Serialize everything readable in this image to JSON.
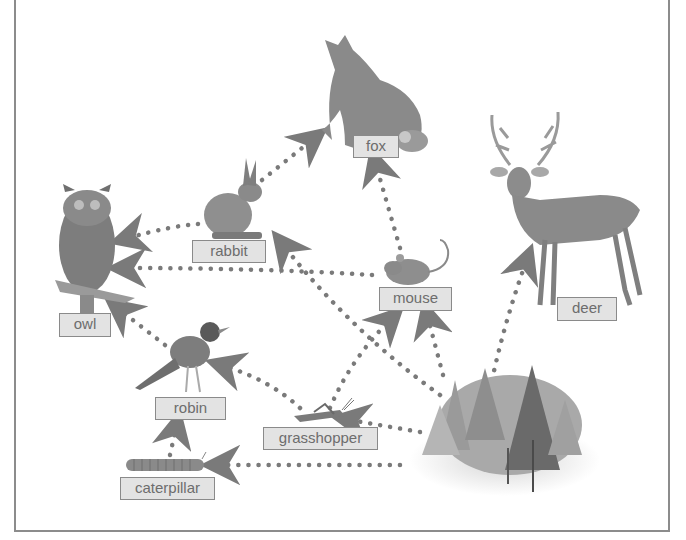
{
  "title_fragment": "... (top line cut off)",
  "organisms": {
    "fox": {
      "label": "fox"
    },
    "rabbit": {
      "label": "rabbit"
    },
    "owl": {
      "label": "owl"
    },
    "mouse": {
      "label": "mouse"
    },
    "deer": {
      "label": "deer"
    },
    "robin": {
      "label": "robin"
    },
    "grasshopper": {
      "label": "grasshopper"
    },
    "caterpillar": {
      "label": "caterpillar"
    },
    "trees": {
      "label": ""
    }
  },
  "arrows": [
    {
      "from": "rabbit",
      "to": "fox"
    },
    {
      "from": "mouse",
      "to": "fox"
    },
    {
      "from": "rabbit",
      "to": "owl"
    },
    {
      "from": "mouse",
      "to": "owl"
    },
    {
      "from": "robin",
      "to": "owl"
    },
    {
      "from": "grasshopper",
      "to": "robin"
    },
    {
      "from": "grasshopper",
      "to": "mouse"
    },
    {
      "from": "caterpillar",
      "to": "robin"
    },
    {
      "from": "trees",
      "to": "caterpillar"
    },
    {
      "from": "trees",
      "to": "grasshopper"
    },
    {
      "from": "trees",
      "to": "mouse"
    },
    {
      "from": "trees",
      "to": "rabbit"
    },
    {
      "from": "trees",
      "to": "deer"
    }
  ],
  "colors": {
    "arrow": "#7a7a7a",
    "label_bg": "#e3e3e3",
    "label_border": "#8a8a8a",
    "label_text": "#6d6d6d",
    "frame": "#8c8c8c"
  }
}
